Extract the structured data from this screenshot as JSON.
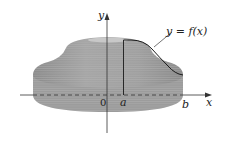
{
  "diagram": {
    "labels": {
      "y_axis": "y",
      "x_axis": "x",
      "origin": "0",
      "a": "a",
      "b": "b",
      "curve": "y = f(x)"
    },
    "colors": {
      "solid_fill": "#9a9a9a",
      "solid_light": "#c4c4c4",
      "solid_dark": "#7e7e7e",
      "axis": "#333333",
      "curve": "#1a1a1a",
      "background": "#ffffff"
    }
  }
}
